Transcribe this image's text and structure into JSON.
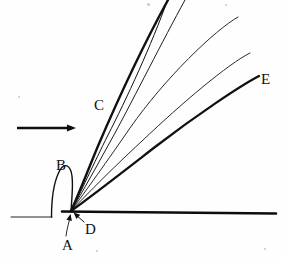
{
  "figure": {
    "width": 282,
    "height": 259,
    "background_color": "#fefefe",
    "ink_color": "#111111",
    "labels": [
      {
        "id": "A",
        "text": "A",
        "x": 62,
        "y": 238,
        "meaning": "wedge-leading-edge-callout"
      },
      {
        "id": "B",
        "text": "B",
        "x": 56,
        "y": 158,
        "meaning": "detached-bow-shock"
      },
      {
        "id": "C",
        "text": "C",
        "x": 94,
        "y": 98,
        "meaning": "attached-oblique-shock"
      },
      {
        "id": "D",
        "text": "D",
        "x": 85,
        "y": 222,
        "meaning": "vertex-callout"
      },
      {
        "id": "E",
        "text": "E",
        "x": 261,
        "y": 72,
        "meaning": "weak-mach-wave"
      }
    ],
    "flow_arrow": {
      "label": "freestream-flow-direction",
      "x1": 17,
      "y1": 128,
      "x2": 76,
      "y2": 128,
      "head_length": 9,
      "head_half_width": 3.6
    },
    "vertex": {
      "x": 71,
      "y": 211
    },
    "baseline": {
      "left_segment": {
        "x1": 11,
        "y1": 217,
        "x2": 52,
        "y2": 217,
        "weight": 1.1
      },
      "main_segment": {
        "x1": 62,
        "y1": 211.5,
        "x2": 276,
        "y2": 213.5,
        "weight": 2.6
      }
    },
    "shock_curves": [
      {
        "id": "curve-B",
        "role": "detached-bow-shock",
        "weight": 1.4,
        "path": "M 51.5 217 C 51.5 201 52.5 186 58.5 173 C 62.5 164 67.5 163.5 70.5 170 C 73.5 176.5 72.5 191 71 211"
      },
      {
        "id": "curve-C",
        "role": "attached-oblique-shock-strong",
        "weight": 2.4,
        "path": "M 71 211 C 78 196 88 170 98 146 C 110 118 134 62 168 0"
      },
      {
        "id": "ray-2",
        "role": "shock-inner-1",
        "weight": 1.0,
        "path": "M 71 211 C 80 194 94 163 108 135 C 126 100 152 44 167.5 0"
      },
      {
        "id": "ray-3",
        "role": "shock-inner-2",
        "weight": 0.95,
        "path": "M 71 211 C 82 193 99 162 115 133 C 134 98 163 40 185 0"
      },
      {
        "id": "ray-4",
        "role": "mach-wave-1",
        "weight": 0.9,
        "path": "M 71 211 C 85 192 108 160 130 128 C 165 78 215 30 238 17"
      },
      {
        "id": "ray-5",
        "role": "mach-wave-2",
        "weight": 0.9,
        "path": "M 71 211 C 88 193 115 166 142 141 C 182 103 228 64 250 53"
      },
      {
        "id": "curve-E",
        "role": "weak-mach-wave-outer",
        "weight": 2.3,
        "path": "M 71 211 C 92 196 124 171 155 147 C 198 114 240 86 259 76"
      }
    ],
    "callout_lines": [
      {
        "id": "callout-A",
        "label": "A-pointer",
        "path": "M 66 236 C 67 228 69 222 70.5 216",
        "weight": 0.9,
        "arrow_at": {
          "x": 70.5,
          "y": 214,
          "angle": -78
        }
      },
      {
        "id": "callout-D",
        "label": "D-pointer",
        "path": "M 84 222 L 75 214",
        "weight": 1.0,
        "arrow_at": {
          "x": 73.5,
          "y": 212.6,
          "angle": -138
        }
      }
    ],
    "paper_specks": [
      {
        "x": 18,
        "y": 96,
        "size": 2
      },
      {
        "x": 147,
        "y": 3,
        "size": 3
      },
      {
        "x": 225,
        "y": 4,
        "size": 2
      },
      {
        "x": 96,
        "y": 250,
        "size": 2
      },
      {
        "x": 264,
        "y": 248,
        "size": 2
      }
    ]
  },
  "chart_data": {
    "type": "line",
    "xlabel": "",
    "ylabel": "",
    "annotations": [
      "A",
      "B",
      "C",
      "D",
      "E"
    ],
    "series": [
      {
        "name": "B",
        "description": "detached bow shock standing ahead of the corner"
      },
      {
        "name": "C",
        "description": "strong attached oblique shock"
      },
      {
        "name": "E",
        "description": "weak / Mach-wave limit"
      }
    ]
  }
}
